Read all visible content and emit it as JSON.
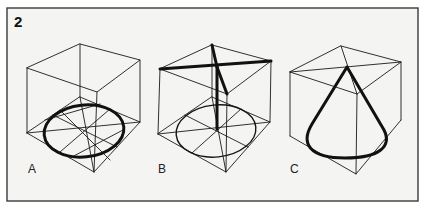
{
  "figure": {
    "number": "2",
    "panels": [
      {
        "label": "A",
        "description": "Cube with inscribed circle (ellipse in perspective) on its base, with construction diagonals and midlines"
      },
      {
        "label": "B",
        "description": "Cube with base circle construction and a bold vertical axis plus bold top diagonal forming a cross"
      },
      {
        "label": "C",
        "description": "Cube with a cone inscribed: base ellipse and two tangent lines meeting at apex on the top face"
      }
    ]
  },
  "colors": {
    "background": "#f4f4f3",
    "line": "#111111",
    "border": "#3a3a3a"
  }
}
